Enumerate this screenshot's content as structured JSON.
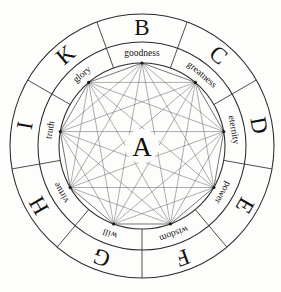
{
  "diagram": {
    "center": {
      "label": "A",
      "name": "center-essence"
    },
    "geometry": {
      "center_x": 142,
      "center_y": 146,
      "outer_radius": 132,
      "middle_radius": 104,
      "inner_radius": 83,
      "sector_count": 9,
      "graph_type": "complete-graph-K9"
    },
    "colors": {
      "background": "#fdfdfc",
      "ring_stroke": "#2b2b2b",
      "divider_stroke": "#3a3a3a",
      "chord_stroke": "#6a6a6a",
      "polygon_stroke": "#4a4a4a",
      "text": "#111111",
      "vertex": "#1a1a1a"
    },
    "sectors": [
      {
        "letter": "B",
        "word": "goodness",
        "angle_deg": 0,
        "name": "sector-b-goodness"
      },
      {
        "letter": "C",
        "word": "greatness",
        "angle_deg": 40,
        "name": "sector-c-greatness"
      },
      {
        "letter": "D",
        "word": "eternity",
        "angle_deg": 80,
        "name": "sector-d-eternity"
      },
      {
        "letter": "E",
        "word": "power",
        "angle_deg": 120,
        "name": "sector-e-power"
      },
      {
        "letter": "F",
        "word": "wisdom",
        "angle_deg": 160,
        "name": "sector-f-wisdom"
      },
      {
        "letter": "G",
        "word": "will",
        "angle_deg": 200,
        "name": "sector-g-will"
      },
      {
        "letter": "H",
        "word": "virtue",
        "angle_deg": 240,
        "name": "sector-h-virtue"
      },
      {
        "letter": "I",
        "word": "truth",
        "angle_deg": 280,
        "name": "sector-i-truth"
      },
      {
        "letter": "K",
        "word": "glory",
        "angle_deg": 320,
        "name": "sector-k-glory"
      }
    ],
    "outer_letters": [
      "B",
      "C",
      "D",
      "E",
      "F",
      "G",
      "H",
      "I",
      "K"
    ],
    "inner_words": [
      "goodness",
      "greatness",
      "eternity",
      "power",
      "wisdom",
      "will",
      "virtue",
      "truth",
      "glory"
    ]
  }
}
